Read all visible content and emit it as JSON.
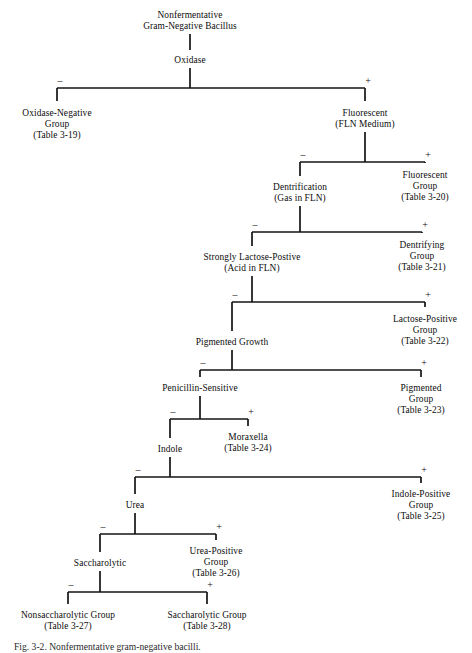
{
  "figure": {
    "caption": "Fig. 3-2. Nonfermentative gram-negative bacilli.",
    "root_label_line1": "Nonfermentative",
    "root_label_line2": "Gram-Negative Bacillus"
  },
  "signs": {
    "negative": "–",
    "positive": "+"
  },
  "nodes": [
    {
      "id": "root",
      "lines": [
        "Nonfermentative",
        "Gram-Negative Bacillus"
      ],
      "x": 190,
      "y": 10,
      "type": "root"
    },
    {
      "id": "oxidase",
      "lines": [
        "Oxidase"
      ],
      "x": 190,
      "y": 55,
      "type": "test"
    },
    {
      "id": "oxidase-neg-group",
      "lines": [
        "Oxidase-Negative",
        "Group",
        "(Table 3-19)"
      ],
      "x": 57,
      "y": 108,
      "type": "terminal"
    },
    {
      "id": "fluorescent",
      "lines": [
        "Fluorescent",
        "(FLN Medium)"
      ],
      "x": 365,
      "y": 108,
      "type": "test"
    },
    {
      "id": "dentrification",
      "lines": [
        "Dentrification",
        "(Gas in FLN)"
      ],
      "x": 300,
      "y": 182,
      "type": "test"
    },
    {
      "id": "fluorescent-group",
      "lines": [
        "Fluorescent",
        "Group",
        "(Table 3-20)"
      ],
      "x": 425,
      "y": 170,
      "type": "terminal"
    },
    {
      "id": "strongly-lactose",
      "lines": [
        "Strongly Lactose-Postive",
        "(Acid in FLN)"
      ],
      "x": 252,
      "y": 252,
      "type": "test"
    },
    {
      "id": "dentrifying-group",
      "lines": [
        "Dentrifying",
        "Group",
        "(Table 3-21)"
      ],
      "x": 422,
      "y": 240,
      "type": "terminal"
    },
    {
      "id": "pigmented-growth",
      "lines": [
        "Pigmented Growth"
      ],
      "x": 232,
      "y": 337,
      "type": "test"
    },
    {
      "id": "lactose-pos-group",
      "lines": [
        "Lactose-Positive",
        "Group",
        "(Table 3-22)"
      ],
      "x": 425,
      "y": 314,
      "type": "terminal"
    },
    {
      "id": "penicillin",
      "lines": [
        "Penicillin-Sensitive"
      ],
      "x": 200,
      "y": 383,
      "type": "test"
    },
    {
      "id": "pigmented-group",
      "lines": [
        "Pigmented",
        "Group",
        "(Table 3-23)"
      ],
      "x": 421,
      "y": 383,
      "type": "terminal"
    },
    {
      "id": "indole",
      "lines": [
        "Indole"
      ],
      "x": 170,
      "y": 444,
      "type": "test"
    },
    {
      "id": "moraxella",
      "lines": [
        "Moraxella",
        "(Table 3-24)"
      ],
      "x": 248,
      "y": 432,
      "type": "terminal"
    },
    {
      "id": "urea",
      "lines": [
        "Urea"
      ],
      "x": 135,
      "y": 500,
      "type": "test"
    },
    {
      "id": "indole-pos-group",
      "lines": [
        "Indole-Positive",
        "Group",
        "(Table 3-25)"
      ],
      "x": 421,
      "y": 489,
      "type": "terminal"
    },
    {
      "id": "saccharolytic",
      "lines": [
        "Saccharolytic"
      ],
      "x": 100,
      "y": 558,
      "type": "test"
    },
    {
      "id": "urea-pos-group",
      "lines": [
        "Urea-Positive",
        "Group",
        "(Table 3-26)"
      ],
      "x": 216,
      "y": 546,
      "type": "terminal"
    },
    {
      "id": "nonsaccharolytic-group",
      "lines": [
        "Nonsaccharolytic Group",
        "(Table 3-27)"
      ],
      "x": 68,
      "y": 610,
      "type": "terminal"
    },
    {
      "id": "saccharolytic-group",
      "lines": [
        "Saccharolytic Group",
        "(Table 3-28)"
      ],
      "x": 207,
      "y": 610,
      "type": "terminal"
    }
  ],
  "branch_labels": [
    {
      "id": "oxidase-minus",
      "sign": "–",
      "x": 60,
      "y": 76
    },
    {
      "id": "oxidase-plus",
      "sign": "+",
      "x": 368,
      "y": 76
    },
    {
      "id": "fluorescent-minus",
      "sign": "–",
      "x": 303,
      "y": 150
    },
    {
      "id": "fluorescent-plus",
      "sign": "+",
      "x": 428,
      "y": 150
    },
    {
      "id": "dentrification-minus",
      "sign": "–",
      "x": 255,
      "y": 220
    },
    {
      "id": "dentrification-plus",
      "sign": "+",
      "x": 425,
      "y": 220
    },
    {
      "id": "lactose-minus",
      "sign": "–",
      "x": 235,
      "y": 290
    },
    {
      "id": "lactose-plus",
      "sign": "+",
      "x": 428,
      "y": 290
    },
    {
      "id": "pigment-minus",
      "sign": "–",
      "x": 203,
      "y": 358
    },
    {
      "id": "pigment-plus",
      "sign": "+",
      "x": 424,
      "y": 358
    },
    {
      "id": "penicillin-minus",
      "sign": "–",
      "x": 173,
      "y": 407
    },
    {
      "id": "penicillin-plus",
      "sign": "+",
      "x": 251,
      "y": 407
    },
    {
      "id": "indole-minus",
      "sign": "–",
      "x": 138,
      "y": 465
    },
    {
      "id": "indole-plus",
      "sign": "+",
      "x": 424,
      "y": 465
    },
    {
      "id": "urea-minus",
      "sign": "–",
      "x": 103,
      "y": 522
    },
    {
      "id": "urea-plus",
      "sign": "+",
      "x": 219,
      "y": 522
    },
    {
      "id": "saccharolytic-minus",
      "sign": "–",
      "x": 71,
      "y": 580
    },
    {
      "id": "saccharolytic-plus",
      "sign": "+",
      "x": 210,
      "y": 580
    }
  ],
  "edges": [
    {
      "id": "root-to-oxidase",
      "type": "vertical",
      "x": 190,
      "y1": 34,
      "y2": 50
    },
    {
      "id": "oxidase-stem",
      "type": "vertical",
      "x": 190,
      "y1": 68,
      "y2": 88
    },
    {
      "id": "oxidase-bar",
      "type": "horizontal",
      "y": 88,
      "x1": 57,
      "x2": 365
    },
    {
      "id": "oxidase-neg-drop",
      "type": "vertical",
      "x": 57,
      "y1": 88,
      "y2": 101
    },
    {
      "id": "oxidase-pos-drop",
      "type": "vertical",
      "x": 365,
      "y1": 88,
      "y2": 101
    },
    {
      "id": "fluorescent-stem",
      "type": "vertical",
      "x": 365,
      "y1": 132,
      "y2": 162
    },
    {
      "id": "fluorescent-bar",
      "type": "horizontal",
      "y": 162,
      "x1": 300,
      "x2": 425
    },
    {
      "id": "fluorescent-neg-drop",
      "type": "vertical",
      "x": 300,
      "y1": 162,
      "y2": 176
    },
    {
      "id": "fluorescent-pos-drop",
      "type": "vertical",
      "x": 425,
      "y1": 162,
      "y2": 163
    },
    {
      "id": "dentrification-stem",
      "type": "vertical",
      "x": 300,
      "y1": 206,
      "y2": 232
    },
    {
      "id": "dentrification-bar",
      "type": "horizontal",
      "y": 232,
      "x1": 252,
      "x2": 422
    },
    {
      "id": "dentrification-neg-drop",
      "type": "vertical",
      "x": 252,
      "y1": 232,
      "y2": 246
    },
    {
      "id": "dentrification-pos-drop",
      "type": "vertical",
      "x": 422,
      "y1": 232,
      "y2": 233
    },
    {
      "id": "lactose-stem",
      "type": "vertical",
      "x": 252,
      "y1": 276,
      "y2": 302
    },
    {
      "id": "lactose-bar",
      "type": "horizontal",
      "y": 302,
      "x1": 232,
      "x2": 425
    },
    {
      "id": "lactose-neg-drop",
      "type": "vertical",
      "x": 232,
      "y1": 302,
      "y2": 331
    },
    {
      "id": "lactose-pos-drop",
      "type": "vertical",
      "x": 425,
      "y1": 302,
      "y2": 307
    },
    {
      "id": "pigment-stem",
      "type": "vertical",
      "x": 232,
      "y1": 350,
      "y2": 370
    },
    {
      "id": "pigment-bar",
      "type": "horizontal",
      "y": 370,
      "x1": 200,
      "x2": 421
    },
    {
      "id": "pigment-neg-drop",
      "type": "vertical",
      "x": 200,
      "y1": 370,
      "y2": 377
    },
    {
      "id": "pigment-pos-drop",
      "type": "vertical",
      "x": 421,
      "y1": 370,
      "y2": 377
    },
    {
      "id": "penicillin-stem",
      "type": "vertical",
      "x": 200,
      "y1": 396,
      "y2": 419
    },
    {
      "id": "penicillin-bar",
      "type": "horizontal",
      "y": 419,
      "x1": 170,
      "x2": 248
    },
    {
      "id": "penicillin-neg-drop",
      "type": "vertical",
      "x": 170,
      "y1": 419,
      "y2": 438
    },
    {
      "id": "penicillin-pos-drop",
      "type": "vertical",
      "x": 248,
      "y1": 419,
      "y2": 426
    },
    {
      "id": "indole-stem",
      "type": "vertical",
      "x": 170,
      "y1": 457,
      "y2": 477
    },
    {
      "id": "indole-bar",
      "type": "horizontal",
      "y": 477,
      "x1": 135,
      "x2": 421
    },
    {
      "id": "indole-neg-drop",
      "type": "vertical",
      "x": 135,
      "y1": 477,
      "y2": 494
    },
    {
      "id": "indole-pos-drop",
      "type": "vertical",
      "x": 421,
      "y1": 477,
      "y2": 483
    },
    {
      "id": "urea-stem",
      "type": "vertical",
      "x": 135,
      "y1": 513,
      "y2": 534
    },
    {
      "id": "urea-bar",
      "type": "horizontal",
      "y": 534,
      "x1": 100,
      "x2": 216
    },
    {
      "id": "urea-neg-drop",
      "type": "vertical",
      "x": 100,
      "y1": 534,
      "y2": 552
    },
    {
      "id": "urea-pos-drop",
      "type": "vertical",
      "x": 216,
      "y1": 534,
      "y2": 540
    },
    {
      "id": "saccharolytic-stem",
      "type": "vertical",
      "x": 100,
      "y1": 571,
      "y2": 592
    },
    {
      "id": "saccharolytic-bar",
      "type": "horizontal",
      "y": 592,
      "x1": 68,
      "x2": 207
    },
    {
      "id": "saccharolytic-neg-drop",
      "type": "vertical",
      "x": 68,
      "y1": 592,
      "y2": 604
    },
    {
      "id": "saccharolytic-pos-drop",
      "type": "vertical",
      "x": 207,
      "y1": 592,
      "y2": 604
    }
  ]
}
